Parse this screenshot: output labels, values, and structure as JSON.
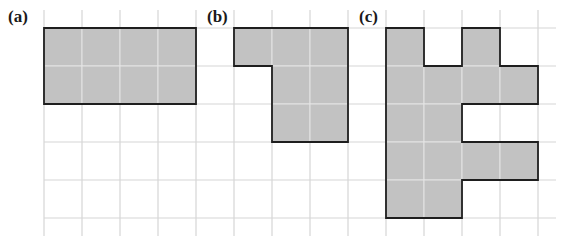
{
  "grid": {
    "origin_x": 44,
    "origin_y": 28,
    "cell": 38,
    "cols": 13,
    "rows": 5,
    "line_color": "#d6d6d6",
    "extend_top": 18,
    "extend_bottom": 18,
    "extend_left": 0,
    "extend_right": 18
  },
  "style": {
    "fill": "#c2c2c2",
    "inner_line": "#e4e4e4",
    "outline": "#1e1e1e"
  },
  "panels": [
    {
      "label": "(a)",
      "label_x": 8,
      "label_y": 8,
      "cells": [
        [
          0,
          0
        ],
        [
          1,
          0
        ],
        [
          2,
          0
        ],
        [
          3,
          0
        ],
        [
          0,
          1
        ],
        [
          1,
          1
        ],
        [
          2,
          1
        ],
        [
          3,
          1
        ]
      ]
    },
    {
      "label": "(b)",
      "label_x": 207,
      "label_y": 8,
      "cells": [
        [
          5,
          0
        ],
        [
          6,
          0
        ],
        [
          7,
          0
        ],
        [
          6,
          1
        ],
        [
          7,
          1
        ],
        [
          6,
          2
        ],
        [
          7,
          2
        ]
      ]
    },
    {
      "label": "(c)",
      "label_x": 359,
      "label_y": 8,
      "cells": [
        [
          9,
          0
        ],
        [
          11,
          0
        ],
        [
          9,
          1
        ],
        [
          10,
          1
        ],
        [
          11,
          1
        ],
        [
          12,
          1
        ],
        [
          9,
          2
        ],
        [
          10,
          2
        ],
        [
          9,
          3
        ],
        [
          10,
          3
        ],
        [
          11,
          3
        ],
        [
          12,
          3
        ],
        [
          9,
          4
        ],
        [
          10,
          4
        ]
      ]
    }
  ]
}
